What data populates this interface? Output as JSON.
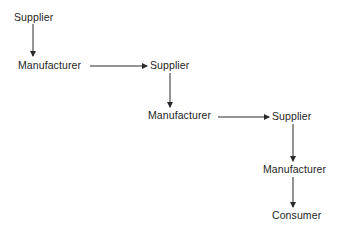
{
  "diagram": {
    "type": "supply-chain-flow",
    "nodes": [
      {
        "id": "n1",
        "label": "Supplier",
        "x": 14,
        "y": 12
      },
      {
        "id": "n2",
        "label": "Manufacturer",
        "x": 18,
        "y": 61
      },
      {
        "id": "n3",
        "label": "Supplier",
        "x": 150,
        "y": 61
      },
      {
        "id": "n4",
        "label": "Manufacturer",
        "x": 148,
        "y": 110
      },
      {
        "id": "n5",
        "label": "Supplier",
        "x": 272,
        "y": 110
      },
      {
        "id": "n6",
        "label": "Manufacturer",
        "x": 263,
        "y": 164
      },
      {
        "id": "n7",
        "label": "Consumer",
        "x": 272,
        "y": 210
      }
    ],
    "edges": [
      {
        "from": "n1",
        "to": "n2",
        "direction": "down"
      },
      {
        "from": "n2",
        "to": "n3",
        "direction": "right"
      },
      {
        "from": "n3",
        "to": "n4",
        "direction": "down"
      },
      {
        "from": "n4",
        "to": "n5",
        "direction": "right"
      },
      {
        "from": "n5",
        "to": "n6",
        "direction": "down"
      },
      {
        "from": "n6",
        "to": "n7",
        "direction": "down"
      }
    ],
    "colors": {
      "line": "#2a2a2a",
      "text": "#1e1e1e",
      "background": "#ffffff"
    }
  }
}
